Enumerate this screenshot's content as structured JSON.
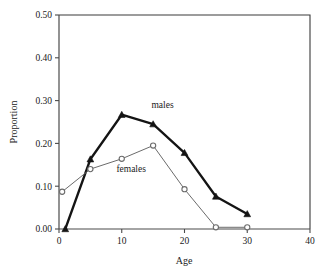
{
  "chart_data": {
    "type": "line",
    "title": "",
    "xlabel": "Age",
    "ylabel": "Proportion",
    "xlim": [
      0,
      40
    ],
    "ylim": [
      0.0,
      0.5
    ],
    "xticks": [
      "0",
      "10",
      "20",
      "30",
      "40"
    ],
    "xtick_values": [
      0,
      10,
      20,
      30,
      40
    ],
    "yticks": [
      "0.00",
      "0.10",
      "0.20",
      "0.30",
      "0.40",
      "0.50"
    ],
    "ytick_values": [
      0.0,
      0.1,
      0.2,
      0.3,
      0.4,
      0.5
    ],
    "grid": false,
    "legend_position": "inline-annotation",
    "series": [
      {
        "name": "males",
        "marker": "filled-triangle",
        "color": "#141414",
        "line_width": 2.3,
        "x": [
          1,
          5,
          10,
          15,
          20,
          25,
          30
        ],
        "values": [
          0.0,
          0.163,
          0.267,
          0.245,
          0.178,
          0.076,
          0.035
        ],
        "label_text": "males",
        "label_x": 16.5,
        "label_y": 0.283
      },
      {
        "name": "females",
        "marker": "open-circle",
        "color": "#6b6b6b",
        "line_width": 1.0,
        "x": [
          0.5,
          5,
          10,
          15,
          20,
          25,
          30
        ],
        "values": [
          0.087,
          0.14,
          0.164,
          0.195,
          0.093,
          0.004,
          0.004
        ],
        "label_text": "females",
        "label_x": 11.5,
        "label_y": 0.133
      }
    ]
  }
}
